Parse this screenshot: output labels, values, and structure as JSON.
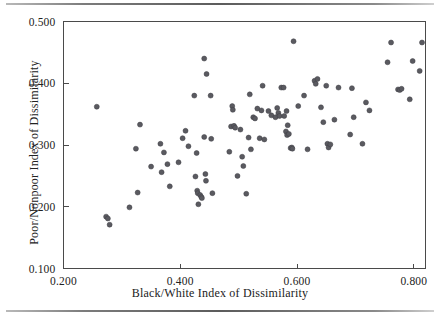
{
  "chart_data": {
    "type": "scatter",
    "title": "",
    "subtitle": "",
    "xlabel": "Black/White Index of Dissimilarity",
    "ylabel": "Poor/Nonpoor Index of Dissimilarity",
    "xlim": [
      0.2,
      0.82
    ],
    "ylim": [
      0.1,
      0.5
    ],
    "xticks": [
      0.2,
      0.4,
      0.6,
      0.8
    ],
    "xtick_labels": [
      "0.200",
      "0.400",
      "0.600",
      "0.800"
    ],
    "yticks": [
      0.1,
      0.2,
      0.3,
      0.4,
      0.5
    ],
    "ytick_labels": [
      "0.100",
      "0.200",
      "0.300",
      "0.400",
      "0.500"
    ],
    "grid": false,
    "legend": null,
    "marker_color": "#5a5a60",
    "marker_size_px": 5,
    "n_points": 118,
    "points": [
      [
        0.257,
        0.362
      ],
      [
        0.273,
        0.184
      ],
      [
        0.276,
        0.181
      ],
      [
        0.279,
        0.171
      ],
      [
        0.313,
        0.199
      ],
      [
        0.324,
        0.294
      ],
      [
        0.327,
        0.223
      ],
      [
        0.331,
        0.333
      ],
      [
        0.35,
        0.265
      ],
      [
        0.366,
        0.302
      ],
      [
        0.368,
        0.256
      ],
      [
        0.372,
        0.288
      ],
      [
        0.378,
        0.269
      ],
      [
        0.382,
        0.233
      ],
      [
        0.397,
        0.272
      ],
      [
        0.404,
        0.311
      ],
      [
        0.409,
        0.323
      ],
      [
        0.414,
        0.298
      ],
      [
        0.424,
        0.38
      ],
      [
        0.426,
        0.249
      ],
      [
        0.428,
        0.287
      ],
      [
        0.429,
        0.226
      ],
      [
        0.43,
        0.222
      ],
      [
        0.431,
        0.204
      ],
      [
        0.434,
        0.219
      ],
      [
        0.436,
        0.216
      ],
      [
        0.437,
        0.214
      ],
      [
        0.441,
        0.44
      ],
      [
        0.441,
        0.313
      ],
      [
        0.443,
        0.253
      ],
      [
        0.444,
        0.242
      ],
      [
        0.445,
        0.415
      ],
      [
        0.452,
        0.38
      ],
      [
        0.453,
        0.31
      ],
      [
        0.455,
        0.222
      ],
      [
        0.484,
        0.289
      ],
      [
        0.487,
        0.33
      ],
      [
        0.489,
        0.363
      ],
      [
        0.49,
        0.357
      ],
      [
        0.492,
        0.331
      ],
      [
        0.494,
        0.328
      ],
      [
        0.498,
        0.25
      ],
      [
        0.503,
        0.325
      ],
      [
        0.506,
        0.281
      ],
      [
        0.508,
        0.266
      ],
      [
        0.513,
        0.221
      ],
      [
        0.517,
        0.312
      ],
      [
        0.519,
        0.382
      ],
      [
        0.521,
        0.293
      ],
      [
        0.525,
        0.345
      ],
      [
        0.528,
        0.343
      ],
      [
        0.532,
        0.359
      ],
      [
        0.536,
        0.311
      ],
      [
        0.539,
        0.356
      ],
      [
        0.541,
        0.396
      ],
      [
        0.544,
        0.309
      ],
      [
        0.551,
        0.355
      ],
      [
        0.556,
        0.348
      ],
      [
        0.563,
        0.345
      ],
      [
        0.566,
        0.36
      ],
      [
        0.568,
        0.352
      ],
      [
        0.57,
        0.347
      ],
      [
        0.573,
        0.393
      ],
      [
        0.577,
        0.393
      ],
      [
        0.578,
        0.347
      ],
      [
        0.581,
        0.322
      ],
      [
        0.582,
        0.355
      ],
      [
        0.583,
        0.316
      ],
      [
        0.584,
        0.332
      ],
      [
        0.586,
        0.318
      ],
      [
        0.589,
        0.295
      ],
      [
        0.591,
        0.296
      ],
      [
        0.592,
        0.294
      ],
      [
        0.594,
        0.468
      ],
      [
        0.602,
        0.363
      ],
      [
        0.612,
        0.38
      ],
      [
        0.618,
        0.293
      ],
      [
        0.63,
        0.404
      ],
      [
        0.632,
        0.399
      ],
      [
        0.635,
        0.407
      ],
      [
        0.641,
        0.361
      ],
      [
        0.645,
        0.337
      ],
      [
        0.65,
        0.396
      ],
      [
        0.652,
        0.302
      ],
      [
        0.654,
        0.296
      ],
      [
        0.657,
        0.301
      ],
      [
        0.664,
        0.341
      ],
      [
        0.671,
        0.393
      ],
      [
        0.691,
        0.317
      ],
      [
        0.694,
        0.392
      ],
      [
        0.697,
        0.345
      ],
      [
        0.712,
        0.302
      ],
      [
        0.718,
        0.369
      ],
      [
        0.724,
        0.356
      ],
      [
        0.755,
        0.434
      ],
      [
        0.761,
        0.466
      ],
      [
        0.773,
        0.39
      ],
      [
        0.776,
        0.389
      ],
      [
        0.779,
        0.391
      ],
      [
        0.793,
        0.374
      ],
      [
        0.798,
        0.436
      ],
      [
        0.81,
        0.42
      ],
      [
        0.814,
        0.466
      ]
    ]
  },
  "axes": {
    "x_label_text": "Black/White Index of Dissimilarity",
    "y_label_text": "Poor/Nonpoor Index of Dissimilarity"
  },
  "decor": {
    "top_rule": "horizontal-rule",
    "bottom_rule": "horizontal-rule"
  }
}
